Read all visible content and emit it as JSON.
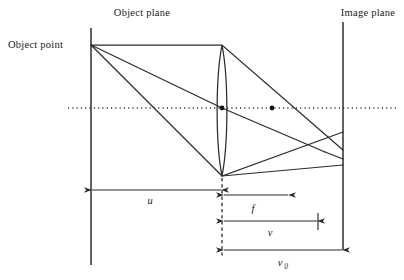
{
  "figure": {
    "kind": "optics-ray-diagram",
    "title_visible": false,
    "background_color": "#ffffff",
    "ink_color": "#2b2b2b",
    "width": 404,
    "height": 280
  },
  "labels": {
    "object_plane": "Object plane",
    "object_point": "Object point",
    "image_plane": "Image plane"
  },
  "dimensions": [
    {
      "id": "u",
      "symbol": "u",
      "subscript": "",
      "style": "double-arrow",
      "from_x": 91,
      "to_x": 222,
      "y": 190,
      "label_x": 150,
      "label_y": 204
    },
    {
      "id": "f",
      "symbol": "f",
      "subscript": "",
      "style": "single-arrow-right",
      "from_x": 224,
      "to_x": 288,
      "y": 195,
      "label_x": 253,
      "label_y": 212
    },
    {
      "id": "v",
      "symbol": "v",
      "subscript": "",
      "style": "arrow-to-tick",
      "from_x": 224,
      "to_x": 318,
      "y": 221,
      "label_x": 270,
      "label_y": 236
    },
    {
      "id": "v0",
      "symbol": "v",
      "subscript": "0",
      "style": "double-arrow",
      "from_x": 224,
      "to_x": 343,
      "y": 250,
      "label_x": 282,
      "label_y": 266
    }
  ],
  "geometry": {
    "object_plane_x": 91,
    "object_plane_y_top": 28,
    "object_plane_y_bottom": 265,
    "image_plane_x": 343,
    "image_plane_y_top": 22,
    "image_plane_y_bottom": 250,
    "object_point_x": 91,
    "object_point_y": 45,
    "lens_center_x": 222,
    "lens_center_y": 108,
    "lens_top_y": 45,
    "lens_bottom_y": 176,
    "lens_half_width": 6.5,
    "optical_axis_y": 108,
    "optical_axis_x_start": 68,
    "optical_axis_x_end": 398,
    "focus_x": 325,
    "focus_y": 152,
    "focal_point_dot_x": 272,
    "focal_point_dot_y": 108,
    "lens_dashed_x": 222,
    "lens_dashed_y_top": 178,
    "lens_dashed_y_bottom": 258
  },
  "rays": [
    {
      "name": "ray-upper-marginal",
      "points": "91,45 222,45 343,150"
    },
    {
      "name": "ray-chief-through-center",
      "points": "91,45 222,108 325,152"
    },
    {
      "name": "ray-lower-marginal",
      "points": "91,45 222,176 343,132"
    },
    {
      "name": "ray-converge-lower-extend",
      "points": "222,176 343,165"
    },
    {
      "name": "ray-axis-to-image-plane",
      "points": "325,152 343,159"
    }
  ],
  "markers": [
    {
      "name": "lens-center-dot",
      "x": 222,
      "y": 108
    },
    {
      "name": "focal-point-dot",
      "x": 272,
      "y": 108
    }
  ]
}
